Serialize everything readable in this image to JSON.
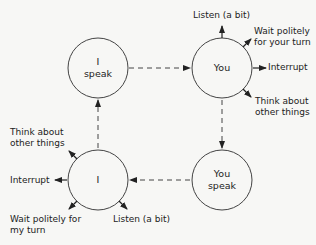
{
  "nodes": {
    "i_speak": {
      "line1": "I",
      "line2": "speak"
    },
    "you": {
      "label": "You"
    },
    "i": {
      "label": "I"
    },
    "you_speak": {
      "line1": "You",
      "line2": "speak"
    }
  },
  "you_outputs": {
    "listen": "Listen (a bit)",
    "wait_1": "Wait politely",
    "wait_2": "for your turn",
    "interrupt": "Interrupt",
    "think_1": "Think about",
    "think_2": "other things"
  },
  "i_outputs": {
    "think_1": "Think about",
    "think_2": "other things",
    "interrupt": "Interrupt",
    "wait_1": "Wait politely for",
    "wait_2": "my turn",
    "listen": "Listen (a bit)"
  },
  "colors": {
    "line": "#333333",
    "background": "#f7f7f5"
  }
}
